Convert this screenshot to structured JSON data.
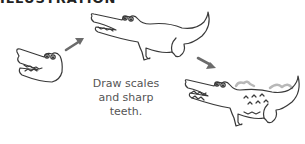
{
  "header": {
    "cut_text": "ILLUSTRATION"
  },
  "caption": {
    "lines": [
      "Draw scales",
      "and sharp",
      "teeth."
    ]
  },
  "steps": [
    {
      "name": "crocodile-head",
      "description": "head outline with eyes and teeth"
    },
    {
      "name": "crocodile-body",
      "description": "full body outline with legs and tail"
    },
    {
      "name": "crocodile-detailed",
      "description": "finished crocodile with scales and sharp teeth"
    }
  ],
  "arrows": [
    {
      "direction": "up-right"
    },
    {
      "direction": "down-right"
    }
  ],
  "colors": {
    "stroke": "#3a3a3a",
    "arrow": "#6b6b6b",
    "scales": "#b8b8b8",
    "caption": "#555555"
  }
}
